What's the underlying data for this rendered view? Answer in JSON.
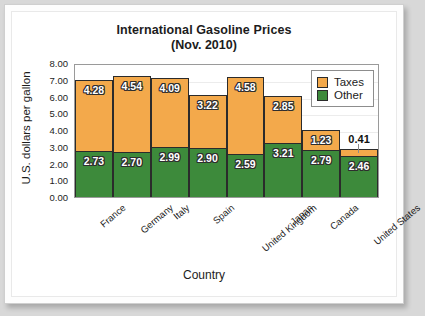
{
  "chart_data": {
    "type": "bar",
    "stacked": true,
    "title": "International Gasoline Prices",
    "subtitle": "(Nov. 2010)",
    "xlabel": "Country",
    "ylabel": "U.S. dollars per gallon",
    "ylim": [
      0.0,
      8.0
    ],
    "ytick_step": 1.0,
    "yticks": [
      "8.00",
      "7.00",
      "6.00",
      "5.00",
      "4.00",
      "3.00",
      "2.00",
      "1.00",
      "0.00"
    ],
    "grid": true,
    "legend_position": "top-right-inside",
    "categories": [
      "France",
      "Germany",
      "Italy",
      "Spain",
      "United Kingdom",
      "Japan",
      "Canada",
      "United States"
    ],
    "series": [
      {
        "name": "Other",
        "color": "#3d8a3b",
        "values": [
          2.73,
          2.7,
          2.99,
          2.9,
          2.59,
          3.21,
          2.79,
          2.46
        ],
        "labels": [
          "2.73",
          "2.70",
          "2.99",
          "2.90",
          "2.59",
          "3.21",
          "2.79",
          "2.46"
        ]
      },
      {
        "name": "Taxes",
        "color": "#f3a94b",
        "values": [
          4.28,
          4.54,
          4.09,
          3.22,
          4.58,
          2.85,
          1.23,
          0.41
        ],
        "labels": [
          "4.28",
          "4.54",
          "4.09",
          "3.22",
          "4.58",
          "2.85",
          "1.23",
          "0.41"
        ]
      }
    ],
    "totals": [
      7.01,
      7.24,
      7.08,
      6.12,
      7.17,
      6.06,
      4.02,
      2.87
    ]
  },
  "legend": {
    "items": [
      {
        "label": "Taxes",
        "color": "#f3a94b"
      },
      {
        "label": "Other",
        "color": "#3d8a3b"
      }
    ]
  }
}
